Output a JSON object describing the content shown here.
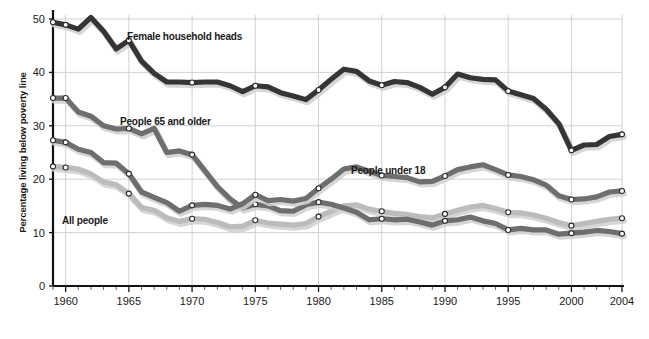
{
  "chart_data": {
    "type": "line",
    "title": "",
    "xlabel": "",
    "ylabel": "Percentage living below poverty line",
    "ylim": [
      0,
      50
    ],
    "xlim": [
      1959,
      2004
    ],
    "ytick_labels": [
      "0",
      "10",
      "20",
      "30",
      "40",
      "50"
    ],
    "ytick_values": [
      0,
      10,
      20,
      30,
      40,
      50
    ],
    "xtick_labels": [
      "1960",
      "1965",
      "1970",
      "1975",
      "1980",
      "1985",
      "1990",
      "1995",
      "2000",
      "2004"
    ],
    "xtick_values": [
      1960,
      1965,
      1970,
      1975,
      1980,
      1985,
      1990,
      1995,
      2000,
      2004
    ],
    "grid": true,
    "legend": "inline-annotations",
    "x": [
      1959,
      1960,
      1961,
      1962,
      1963,
      1964,
      1965,
      1966,
      1967,
      1968,
      1969,
      1970,
      1971,
      1972,
      1973,
      1974,
      1975,
      1976,
      1977,
      1978,
      1979,
      1980,
      1981,
      1982,
      1983,
      1984,
      1985,
      1986,
      1987,
      1988,
      1989,
      1990,
      1991,
      1992,
      1993,
      1994,
      1995,
      1996,
      1997,
      1998,
      1999,
      2000,
      2001,
      2002,
      2003,
      2004
    ],
    "series": [
      {
        "name": "Female household heads",
        "color": "#353535",
        "values": [
          49.4,
          48.9,
          48.1,
          50.3,
          47.7,
          44.4,
          46.0,
          42.1,
          39.8,
          38.2,
          38.2,
          38.1,
          38.2,
          38.2,
          37.5,
          36.4,
          37.5,
          37.3,
          36.2,
          35.6,
          34.9,
          36.7,
          38.7,
          40.6,
          40.2,
          38.4,
          37.6,
          38.3,
          38.1,
          37.2,
          35.9,
          37.2,
          39.7,
          39.0,
          38.7,
          38.6,
          36.5,
          35.8,
          35.1,
          33.1,
          30.4,
          25.4,
          26.4,
          26.5,
          28.0,
          28.4
        ]
      },
      {
        "name": "People 65 and older",
        "color": "#6e6e6e",
        "values": [
          35.2,
          35.2,
          32.6,
          31.8,
          30.0,
          29.4,
          29.5,
          28.5,
          29.5,
          25.0,
          25.3,
          24.6,
          21.6,
          18.6,
          16.3,
          14.6,
          15.3,
          15.0,
          14.1,
          14.0,
          15.2,
          15.7,
          15.3,
          14.6,
          13.8,
          12.4,
          12.6,
          12.4,
          12.5,
          12.0,
          11.4,
          12.2,
          12.4,
          12.9,
          12.2,
          11.7,
          10.5,
          10.8,
          10.5,
          10.5,
          9.7,
          9.9,
          10.1,
          10.4,
          10.2,
          9.8
        ]
      },
      {
        "name": "People under 18",
        "color": "#6e6e6e",
        "values": [
          27.3,
          26.9,
          25.6,
          25.0,
          23.1,
          23.0,
          21.0,
          17.6,
          16.6,
          15.6,
          14.0,
          15.1,
          15.3,
          15.1,
          14.4,
          15.4,
          17.1,
          16.0,
          16.2,
          15.9,
          16.4,
          18.3,
          20.0,
          21.9,
          22.3,
          21.5,
          20.7,
          20.5,
          20.3,
          19.5,
          19.6,
          20.6,
          21.8,
          22.3,
          22.7,
          21.8,
          20.8,
          20.5,
          19.9,
          18.9,
          16.9,
          16.2,
          16.3,
          16.7,
          17.6,
          17.8
        ]
      },
      {
        "name": "All people",
        "color": "#bcbcbc",
        "values": [
          22.4,
          22.2,
          21.9,
          21.0,
          19.5,
          19.0,
          17.3,
          14.7,
          14.2,
          12.8,
          12.1,
          12.6,
          12.5,
          11.9,
          11.1,
          11.2,
          12.3,
          11.8,
          11.6,
          11.4,
          11.7,
          13.0,
          14.0,
          15.0,
          15.2,
          14.4,
          14.0,
          13.6,
          13.4,
          13.0,
          12.8,
          13.5,
          14.2,
          14.8,
          15.1,
          14.5,
          13.8,
          13.7,
          13.3,
          12.7,
          11.9,
          11.3,
          11.7,
          12.1,
          12.5,
          12.7
        ]
      }
    ],
    "annotations": [
      {
        "text": "Female household heads",
        "x_px": 127,
        "y_px": 40
      },
      {
        "text": "People 65 and older",
        "x_px": 120,
        "y_px": 125
      },
      {
        "text": "People under 18",
        "x_px": 351,
        "y_px": 174
      },
      {
        "text": "All people",
        "x_px": 62,
        "y_px": 224
      }
    ]
  }
}
